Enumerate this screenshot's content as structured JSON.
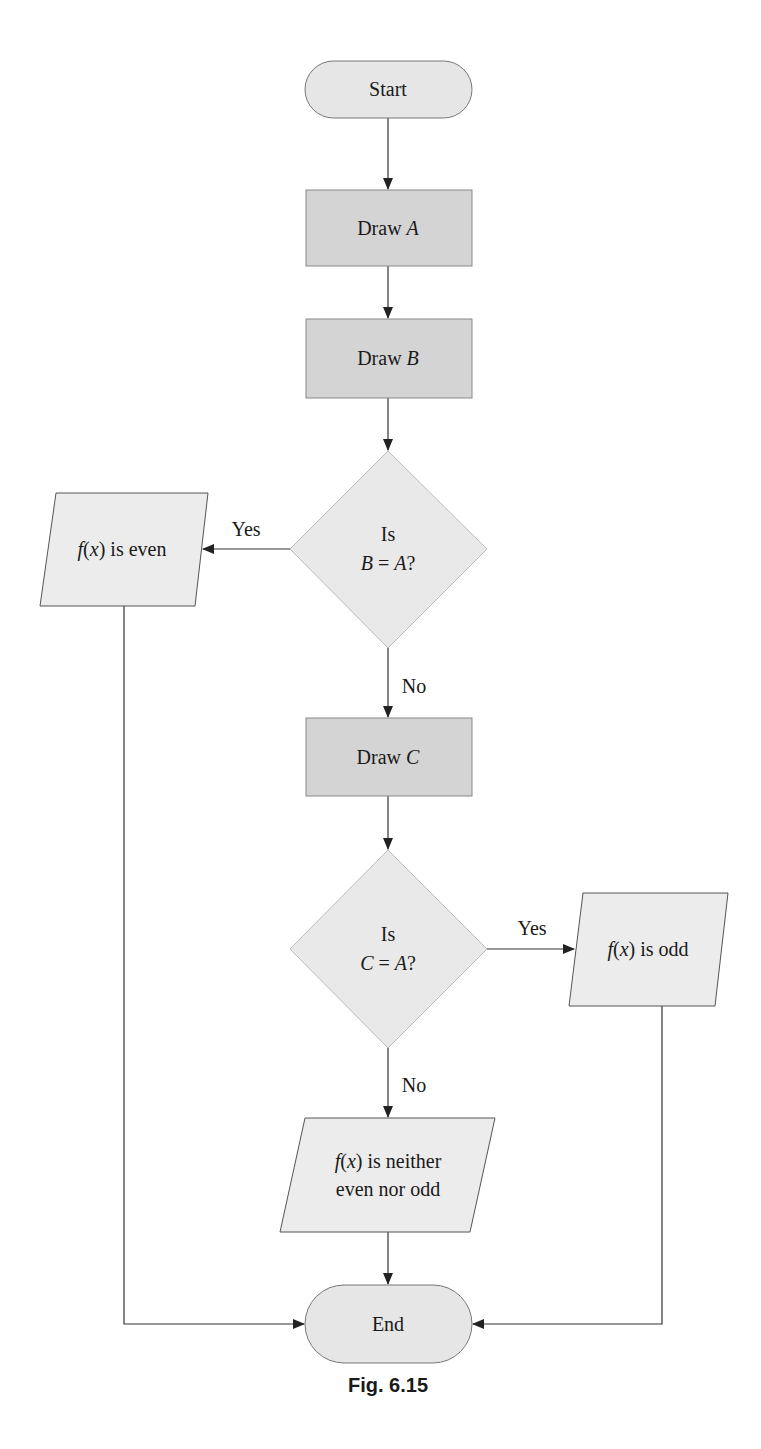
{
  "figure": {
    "caption": "Fig. 6.15",
    "colors": {
      "terminal_fill": "#e6e6e6",
      "process_fill": "#d4d4d4",
      "decision_fill": "#e9e9e9",
      "io_fill": "#ececec",
      "stroke": "#555555",
      "line": "#333333"
    }
  },
  "nodes": {
    "start": {
      "label": "Start"
    },
    "draw_a": {
      "prefix": "Draw ",
      "var": "A"
    },
    "draw_b": {
      "prefix": "Draw ",
      "var": "B"
    },
    "decision_b": {
      "line1": "Is",
      "lhs": "B",
      "eq": " = ",
      "rhs": "A",
      "q": "?"
    },
    "even": {
      "fx": "f",
      "open": "(",
      "x": "x",
      "close": ")",
      "rest": " is even"
    },
    "draw_c": {
      "prefix": "Draw ",
      "var": "C"
    },
    "decision_c": {
      "line1": "Is",
      "lhs": "C",
      "eq": " = ",
      "rhs": "A",
      "q": "?"
    },
    "odd": {
      "fx": "f",
      "open": "(",
      "x": "x",
      "close": ")",
      "rest": " is odd"
    },
    "neither": {
      "fx": "f",
      "open": "(",
      "x": "x",
      "close": ")",
      "rest": " is neither",
      "line2": "even nor odd"
    },
    "end": {
      "label": "End"
    }
  },
  "edges": {
    "b_yes": "Yes",
    "b_no": "No",
    "c_yes": "Yes",
    "c_no": "No"
  }
}
